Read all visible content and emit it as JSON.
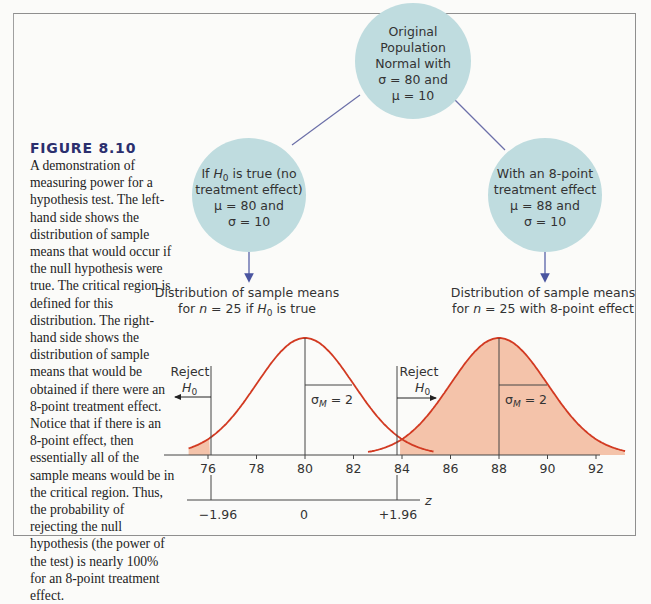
{
  "caption": {
    "title": "FIGURE 8.10",
    "body": "A demonstration of measuring power for a hypothesis test. The left-hand side shows the distribution of sample means that would occur if the null hypothesis were true. The critical region is defined for this distribution. The right-hand side shows the distribution of sample means that would be obtained if there were an 8-point treatment effect. Notice that if there is an 8-point effect, then essentially all of the sample means would be in the critical region. Thus, the probability of rejecting the null hypothesis (the power of the test) is nearly 100% for an 8-point treatment effect."
  },
  "nodes": {
    "top": {
      "lines": [
        "Original",
        "Population",
        "Normal with",
        "σ = 80 and",
        "μ = 10"
      ]
    },
    "left": {
      "line1_pre": "If ",
      "line1_h": "H",
      "line1_sub": "0",
      "line1_post": " is true (no",
      "line2": "treatment effect)",
      "line3": "μ = 80 and",
      "line4": "σ = 10"
    },
    "right": {
      "lines": [
        "With an 8-point",
        "treatment effect",
        "μ = 88 and",
        "σ = 10"
      ]
    }
  },
  "distribution_labels": {
    "left": {
      "line1": "Distribution of sample means",
      "line2_pre": "for ",
      "line2_n": "n",
      "line2_mid": " = 25 if ",
      "line2_h": "H",
      "line2_sub": "0",
      "line2_post": " is true"
    },
    "right": {
      "line1": "Distribution of sample means",
      "line2_pre": "for ",
      "line2_n": "n",
      "line2_post": " = 25 with 8-point effect"
    }
  },
  "reject_labels": {
    "left": {
      "word": "Reject",
      "h": "H",
      "sub": "0"
    },
    "right": {
      "word": "Reject",
      "h": "H",
      "sub": "0"
    }
  },
  "sigma_labels": {
    "left": {
      "sigma": "σ",
      "sub": "M",
      "value": " = 2"
    },
    "right": {
      "sigma": "σ",
      "sub": "M",
      "value": " = 2"
    }
  },
  "colors": {
    "node_fill": "#bfdcdf",
    "curve": "#d23a22",
    "shade": "#f4c3aa",
    "connector": "#6b6fa8",
    "arrow": "#4a55a0"
  },
  "chart_data": {
    "type": "area",
    "title": "FIGURE 8.10",
    "xlabel": "",
    "ylabel": "",
    "x_ticks": [
      "76",
      "78",
      "80",
      "82",
      "84",
      "86",
      "88",
      "90",
      "92"
    ],
    "z_axis": {
      "label": "z",
      "ticks": [
        "−1.96",
        "0",
        "+1.96"
      ],
      "tick_x_values": [
        76.08,
        80,
        83.92
      ]
    },
    "xlim": [
      74.7,
      93.3
    ],
    "series": [
      {
        "name": "Distribution of sample means for n = 25 if H0 is true",
        "mean": 80,
        "sd": 2,
        "shaded_region": "x < 76.08"
      },
      {
        "name": "Distribution of sample means for n = 25 with 8-point effect",
        "mean": 88,
        "sd": 2,
        "shaded_region": "x > 83.92"
      }
    ],
    "critical_values": [
      76.08,
      83.92
    ],
    "annotations": [
      "Reject H0",
      "Reject H0",
      "σM = 2",
      "σM = 2"
    ],
    "grid": false,
    "legend": "none"
  }
}
